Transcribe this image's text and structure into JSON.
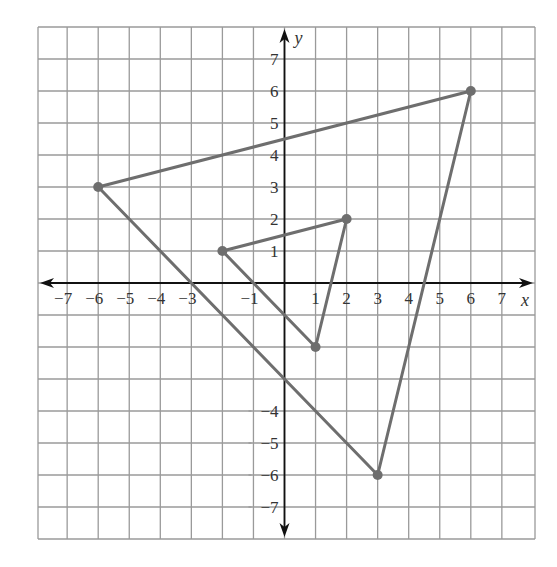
{
  "chart_data": {
    "type": "scatter",
    "title": "",
    "xlabel": "x",
    "ylabel": "y",
    "xlim": [
      -8,
      8
    ],
    "ylim": [
      -8,
      8
    ],
    "grid": true,
    "x_tick_labels": [
      "-7",
      "-6",
      "-5",
      "-4",
      "-3",
      "-1",
      "1",
      "2",
      "3",
      "4",
      "5",
      "6",
      "7"
    ],
    "y_tick_labels": [
      "7",
      "6",
      "5",
      "4",
      "3",
      "2",
      "1",
      "-4",
      "-5",
      "-6",
      "-7"
    ],
    "series": [
      {
        "name": "small-triangle",
        "shape": "polygon",
        "points": [
          [
            -2,
            1
          ],
          [
            2,
            2
          ],
          [
            1,
            -2
          ]
        ]
      },
      {
        "name": "large-triangle",
        "shape": "polygon",
        "points": [
          [
            -6,
            3
          ],
          [
            6,
            6
          ],
          [
            3,
            -6
          ]
        ]
      }
    ]
  },
  "colors": {
    "grid": "#9a9a9a",
    "axis": "#111111",
    "shape": "#6e6e6e",
    "text": "#333333"
  },
  "layout": {
    "origin_px": [
      284.5,
      283
    ],
    "unit_px_x": 31.05,
    "unit_px_y": 32,
    "grid_left": 38,
    "grid_top": 27,
    "grid_right": 535,
    "grid_bottom": 539
  }
}
